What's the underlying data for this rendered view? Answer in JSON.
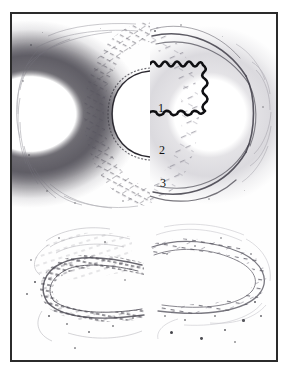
{
  "figure": {
    "kind": "histology-micrograph-composite",
    "panel_count": 4,
    "frame_color": "#2b2b2b",
    "background_color": "#ffffff"
  },
  "labels": [
    {
      "id": "1",
      "text": "1",
      "refers_to": "internal-elastic-lamina"
    },
    {
      "id": "2",
      "text": "2",
      "refers_to": "tunica-media"
    },
    {
      "id": "3",
      "text": "3",
      "refers_to": "external-elastic-lamina-adventitia"
    }
  ],
  "panels": {
    "top_left": {
      "name": "dark-stained-vessel-wall",
      "stain_tone": "#6a6870"
    },
    "top_right": {
      "name": "light-stained-vessel-wall",
      "stain_tone": "#bebcc4"
    },
    "bottom_left": {
      "name": "dark-stained-elastic-fibre-section",
      "stain_tone": "#4a4850"
    },
    "bottom_right": {
      "name": "light-stained-elastic-fibre-section",
      "stain_tone": "#8a8892"
    }
  },
  "structures": {
    "lumen": "lumen-white-space",
    "elastic_lamina": "wavy-black-lamina-line",
    "lamina_color": "#121212"
  }
}
